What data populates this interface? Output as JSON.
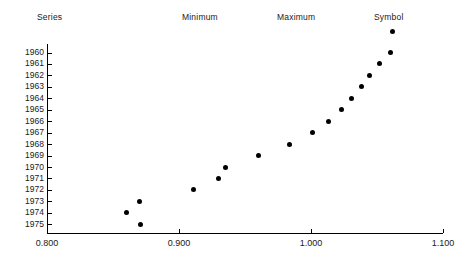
{
  "headers": {
    "series": "Series",
    "minimum": "Minimum",
    "maximum": "Maximum",
    "symbol": "Symbol"
  },
  "legend": {
    "symbol_marker": "filled-circle",
    "symbol_color": "#000000"
  },
  "chart_data": {
    "type": "scatter",
    "title": "",
    "xlabel": "",
    "ylabel": "",
    "orientation": "horizontal",
    "grid": false,
    "legend_position": "top-right",
    "xlim": [
      0.8,
      1.1
    ],
    "xticks": [
      "0.800",
      "0.900",
      "1.000",
      "1.100"
    ],
    "xtick_values": [
      0.8,
      0.9,
      1.0,
      1.1
    ],
    "categories": [
      "1960",
      "1961",
      "1962",
      "1963",
      "1964",
      "1965",
      "1966",
      "1967",
      "1968",
      "1969",
      "1970",
      "1971",
      "1972",
      "1973",
      "1974",
      "1975"
    ],
    "series": [
      {
        "name": "Symbol",
        "marker": "filled-circle",
        "color": "#000000",
        "values": [
          1.06,
          1.052,
          1.044,
          1.038,
          1.031,
          1.023,
          1.013,
          1.001,
          0.984,
          0.96,
          0.935,
          0.93,
          0.911,
          0.87,
          0.86,
          0.871
        ]
      }
    ]
  }
}
